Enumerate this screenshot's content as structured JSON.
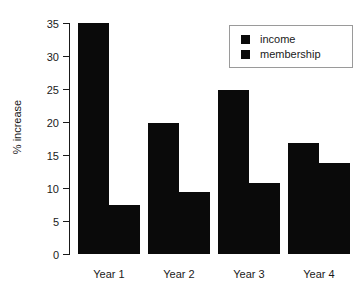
{
  "chart_data": {
    "type": "bar",
    "title": "",
    "xlabel": "",
    "ylabel": "% increase",
    "categories": [
      "Year 1",
      "Year 2",
      "Year 3",
      "Year 4"
    ],
    "series": [
      {
        "name": "income",
        "values": [
          35.0,
          19.9,
          24.9,
          16.8
        ]
      },
      {
        "name": "membership",
        "values": [
          7.4,
          9.4,
          10.8,
          13.8
        ]
      }
    ],
    "ylim": [
      0,
      35
    ],
    "yticks": [
      0,
      5,
      10,
      15,
      20,
      25,
      30,
      35
    ],
    "ytick_labels": [
      "0",
      "5",
      "10",
      "15",
      "20",
      "25",
      "30",
      "35"
    ],
    "grid": false,
    "legend_position": "upper right",
    "bar_color": "#0a0a0a",
    "axis_color": "#1a1a1a",
    "background_color": "#ffffff"
  },
  "legend": {
    "entries": [
      {
        "label": "income"
      },
      {
        "label": "membership"
      }
    ]
  }
}
